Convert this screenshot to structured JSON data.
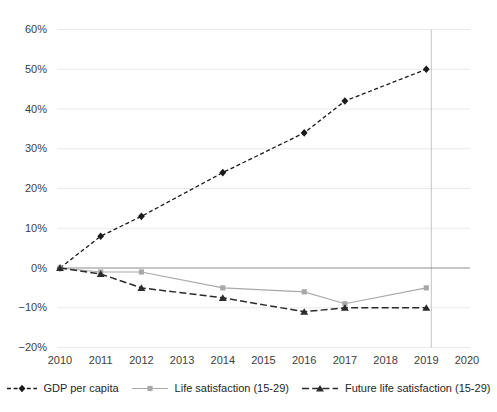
{
  "chart_data": {
    "type": "line",
    "title": "",
    "xlabel": "",
    "ylabel": "",
    "xlim": [
      2010,
      2020
    ],
    "ylim": [
      -20,
      60
    ],
    "grid": true,
    "legend_position": "bottom",
    "x_ticks": {
      "values": [
        2010,
        2011,
        2012,
        2013,
        2014,
        2015,
        2016,
        2017,
        2018,
        2019,
        2020
      ],
      "labels": [
        "2010",
        "2011",
        "2012",
        "2013",
        "2014",
        "2015",
        "2016",
        "2017",
        "2018",
        "2019",
        "2020"
      ]
    },
    "y_ticks": {
      "values": [
        60,
        50,
        40,
        30,
        20,
        10,
        0,
        -10,
        -20
      ],
      "labels": [
        "60%",
        "50%",
        "40%",
        "30%",
        "20%",
        "10%",
        "0%",
        "−10%",
        "−20%"
      ]
    },
    "zero_line_y": 0,
    "reference_line": {
      "x": 2019
    },
    "series": [
      {
        "name": "GDP per capita",
        "color": "#1a1a1a",
        "line_style": "dashed-short",
        "marker": "diamond",
        "points": {
          "x": [
            2010,
            2011,
            2012,
            2014,
            2016,
            2017,
            2019
          ],
          "y": [
            0,
            8,
            13,
            24,
            34,
            42,
            50
          ]
        }
      },
      {
        "name": "Life satisfaction (15-29)",
        "color": "#a9a9a9",
        "line_style": "solid",
        "marker": "square",
        "points": {
          "x": [
            2010,
            2011,
            2012,
            2014,
            2016,
            2017,
            2019
          ],
          "y": [
            0,
            -1,
            -1,
            -5,
            -6,
            -9,
            -5
          ]
        }
      },
      {
        "name": "Future life satisfaction (15-29)",
        "color": "#2b2b2b",
        "line_style": "dashed-long",
        "marker": "triangle",
        "points": {
          "x": [
            2010,
            2011,
            2012,
            2014,
            2016,
            2017,
            2019
          ],
          "y": [
            0,
            -1.5,
            -5,
            -7.5,
            -11,
            -10,
            -10
          ]
        }
      }
    ],
    "colors": {
      "background": "#ffffff",
      "gridline": "#e9e9e9",
      "zero_line": "#8c8c8c",
      "reference_line": "#c4c4c4",
      "tick_text": "#3d3d3d"
    }
  }
}
